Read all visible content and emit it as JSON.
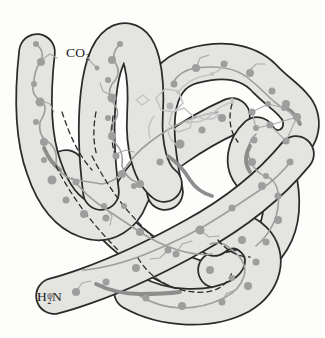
{
  "figure": {
    "c_terminus_label": "CO₂",
    "n_terminus_label": "H₂N"
  },
  "colors": {
    "background": "#fdfdfc",
    "tube_fill": "#e4e4e1",
    "tube_outline": "#2b2b2b",
    "backbone": "#9e9e9e",
    "backbone_dark": "#8d8d8d",
    "residue_dot": "#9e9e9e",
    "heme_outline": "#c4c4c4",
    "label_color": "#1b1b1b"
  }
}
